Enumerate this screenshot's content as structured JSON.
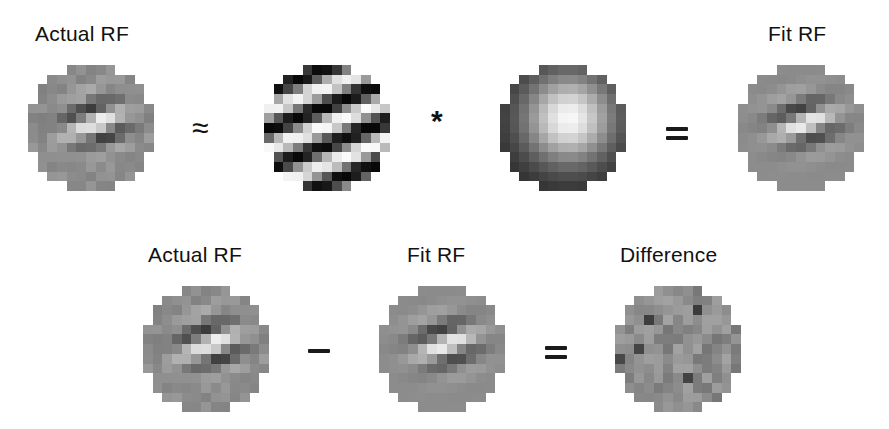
{
  "figure": {
    "top_row": {
      "panels": [
        {
          "id": "actual_rf_top",
          "label": "Actual RF",
          "kind": "gabor-like receptive field (measured)"
        },
        {
          "id": "grating",
          "label": "",
          "kind": "oriented sinusoidal grating"
        },
        {
          "id": "gaussian",
          "label": "",
          "kind": "gaussian envelope"
        },
        {
          "id": "fit_rf_top",
          "label": "Fit RF",
          "kind": "gabor fit"
        }
      ],
      "operators": {
        "approx": "≈",
        "times": "*",
        "equals": "="
      }
    },
    "bottom_row": {
      "panels": [
        {
          "id": "actual_rf_bottom",
          "label": "Actual RF"
        },
        {
          "id": "fit_rf_bottom",
          "label": "Fit RF"
        },
        {
          "id": "difference",
          "label": "Difference"
        }
      ],
      "operators": {
        "minus": "−",
        "equals": "="
      }
    },
    "grid_size": 13,
    "colors": {
      "background": "#ffffff",
      "text": "#111111"
    }
  }
}
